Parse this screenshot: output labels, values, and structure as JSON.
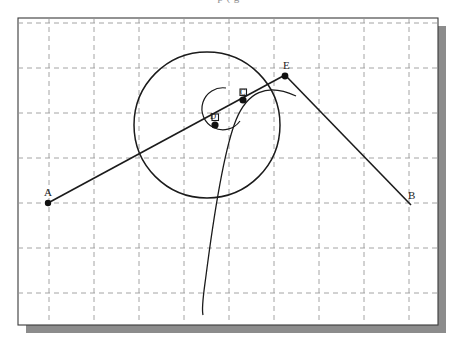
{
  "caption": {
    "clipped_text_above": "p    (   g"
  },
  "figure": {
    "title": "",
    "frame": {
      "x": 18,
      "y": 18,
      "width": 420,
      "height": 307,
      "border_color": "#3a3a3a",
      "fill_color": "#ffffff",
      "shadow_color": "#8c8c8c",
      "shadow_offset": 8
    },
    "grid": {
      "color": "#9a9a9a",
      "style": "dashed",
      "spacing": 45,
      "vertical_x": [
        49,
        94,
        139,
        184,
        229,
        274,
        319,
        364,
        409
      ],
      "horizontal_y": [
        23,
        68,
        113,
        158,
        203,
        248,
        293
      ]
    },
    "stroke_color": "#1b1b1b",
    "circle": {
      "name": "circle",
      "cx": 207,
      "cy": 125,
      "r": 73
    },
    "points": [
      {
        "id": "A",
        "label": "A",
        "x": 48,
        "y": 203,
        "marked": true,
        "label_dx": -1,
        "label_dy": -6
      },
      {
        "id": "D",
        "label": "D",
        "x": 215,
        "y": 125,
        "marked": true,
        "label_dx": -1,
        "label_dy": -5
      },
      {
        "id": "C",
        "label": "C",
        "x": 243,
        "y": 100,
        "marked": true,
        "label_dx": 2,
        "label_dy": -5
      },
      {
        "id": "E",
        "label": "E",
        "x": 283,
        "y": 77,
        "marked": true,
        "label_dx": 2,
        "label_dy": -8
      },
      {
        "id": "B",
        "label": "B",
        "x": 410,
        "y": 203,
        "marked": false,
        "label_dx": 2,
        "label_dy": -4
      }
    ],
    "segments": [
      {
        "name": "segment-AE",
        "from": "A",
        "to": "E",
        "x1": 48,
        "y1": 203,
        "x2": 285,
        "y2": 75
      },
      {
        "name": "segment-EB",
        "from": "E",
        "to": "B",
        "x1": 285,
        "y1": 75,
        "x2": 411,
        "y2": 205
      }
    ],
    "curve": {
      "name": "through-curve",
      "description": "smooth curve passing through C descending to lower area",
      "path": "M 296,96 C 266,82 247,93 236,120 C 224,150 214,215 207,268 C 204,292 201,307 203,315"
    },
    "angle_arc": {
      "name": "angle-arc-at-C",
      "vertex": "C",
      "radius": 22,
      "path": "M 225,89 A 22 22 0 1 0 239,122"
    },
    "right_angle_marks": [
      {
        "name": "mark-at-D",
        "x": 215,
        "y": 125
      },
      {
        "name": "mark-at-C",
        "x": 243,
        "y": 100
      }
    ]
  }
}
